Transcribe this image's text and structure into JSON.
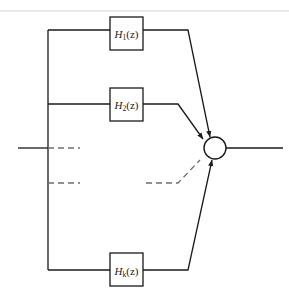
{
  "figure": {
    "colors": {
      "line": "#1a1a1a",
      "dashed": "#6d6d6d",
      "top_rule": "#e3e3e3",
      "background": "#ffffff",
      "text": "#1a1a1a"
    }
  },
  "blocks": [
    {
      "id": "h1",
      "letter": "H",
      "subscript": "1",
      "arg": "(z)",
      "label": "H1(z)"
    },
    {
      "id": "h2",
      "letter": "H",
      "subscript": "2",
      "arg": "(z)",
      "label": "H2(z)"
    },
    {
      "id": "hk",
      "letter": "H",
      "subscript": "k",
      "arg": "(z)",
      "label": "Hk(z)"
    }
  ],
  "nodes": {
    "summing_junction": {
      "symbol": "",
      "shape": "circle"
    }
  },
  "signals": {
    "input": "",
    "output": ""
  },
  "ellipsis": {
    "upper_dashed": "",
    "lower_dashed": "",
    "diagonal_dashed": ""
  }
}
